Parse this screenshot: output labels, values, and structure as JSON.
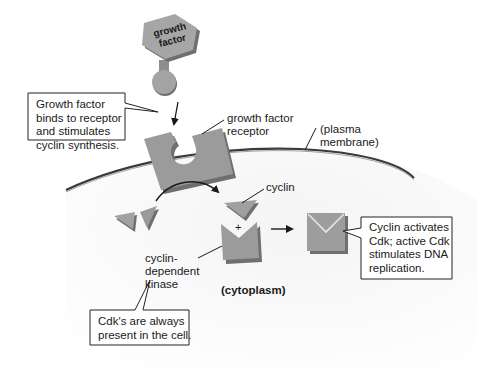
{
  "diagram": {
    "type": "biology-signaling-pathway",
    "colors": {
      "shape_fill": "#9b9b9b",
      "shape_shadow": "#6f6f6f",
      "membrane": "#3a3a3a",
      "cytoplasm_shade": "#efefef",
      "text": "#1a1a1a",
      "callout_border": "#222222"
    },
    "molecules": {
      "growth_factor": {
        "label": "growth\nfactor"
      }
    },
    "labels": {
      "receptor": "growth factor\nreceptor",
      "plasma_membrane": "(plasma\nmembrane)",
      "cyclin": "cyclin",
      "cdk": "cyclin-\ndependent\nkinase",
      "cytoplasm": "(cytoplasm)",
      "plus": "+"
    },
    "callouts": {
      "binding": "Growth factor\nbinds to receptor\nand stimulates\ncyclin synthesis.",
      "activation": "Cyclin activates\nCdk; active Cdk\nstimulates DNA\nreplication.",
      "cdk_presence": "Cdk's are always\npresent in the cell."
    },
    "nodes": [
      {
        "id": "growth-factor",
        "label": "growth factor"
      },
      {
        "id": "receptor",
        "label": "growth factor receptor"
      },
      {
        "id": "cyclin",
        "label": "cyclin"
      },
      {
        "id": "cdk",
        "label": "cyclin-dependent kinase"
      },
      {
        "id": "active-cdk",
        "label": "active Cdk"
      }
    ],
    "edges": [
      {
        "from": "growth-factor",
        "to": "receptor",
        "type": "binds"
      },
      {
        "from": "receptor",
        "to": "cyclin",
        "type": "stimulates synthesis"
      },
      {
        "from": "cyclin",
        "to": "active-cdk",
        "type": "activates",
        "with": "cdk"
      }
    ]
  }
}
